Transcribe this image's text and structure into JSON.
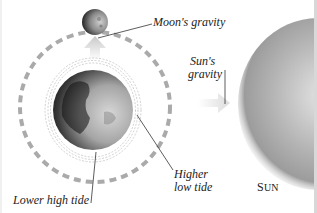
{
  "diagram": {
    "labels": {
      "moon_gravity": "Moon's gravity",
      "sun_gravity_line1": "Sun's",
      "sun_gravity_line2": "gravity",
      "higher_low_tide_line1": "Higher",
      "higher_low_tide_line2": "low tide",
      "lower_high_tide": "Lower high tide",
      "sun_first": "S",
      "sun_rest": "UN"
    },
    "colors": {
      "orbit": "#aaaaaa",
      "arrow": "#c8c8c8",
      "leader": "#333333",
      "text": "#222222",
      "sun": "#a8a8a8",
      "earth_dark": "#1a1a1a",
      "earth_light": "#cfcfcf"
    }
  }
}
